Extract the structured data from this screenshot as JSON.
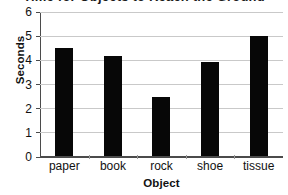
{
  "chart_data": {
    "type": "bar",
    "title": "Time for Objects to Reach the Ground",
    "xlabel": "Object",
    "ylabel": "Seconds",
    "categories": [
      "paper",
      "book",
      "rock",
      "shoe",
      "tissue"
    ],
    "values": [
      4.5,
      4.2,
      2.5,
      3.95,
      5.0
    ],
    "ylim": [
      0,
      6
    ],
    "y_ticks": [
      0,
      1,
      2,
      3,
      4,
      5,
      6
    ],
    "y_tick_labels": [
      "0",
      "1",
      "2",
      "3",
      "4",
      "5",
      "6"
    ],
    "grid": true,
    "legend": "none",
    "bar_color": "#070707",
    "gridline_color": "#c9c9c9",
    "axis_color": "#4b4b4b",
    "background_color": "#ffffff"
  }
}
